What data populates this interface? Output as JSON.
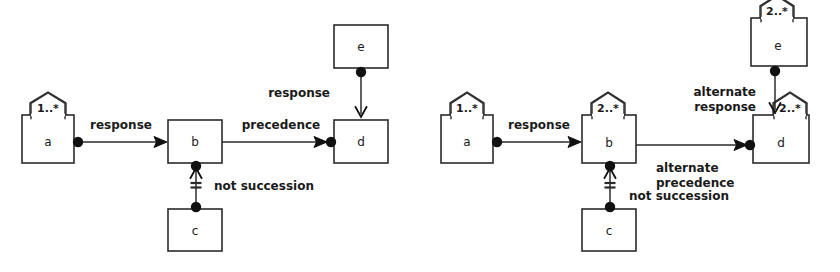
{
  "figure": {
    "type": "diagram",
    "kind": "declare-constraint-graph",
    "background_color": "#ffffff",
    "stroke_color": "#2b2b2b",
    "fill_color": "#ffffff",
    "width": 840,
    "height": 272
  },
  "diagrams": [
    {
      "id": "left",
      "nodes": [
        {
          "id": "a",
          "label": "a",
          "tag": "1..*",
          "x": 22,
          "y": 115,
          "w": 52,
          "h": 48,
          "tag_cx": 48
        },
        {
          "id": "b",
          "label": "b",
          "tag": "",
          "x": 168,
          "y": 120,
          "w": 54,
          "h": 43,
          "tag_cx": 195
        },
        {
          "id": "c",
          "label": "c",
          "tag": "",
          "x": 168,
          "y": 209,
          "w": 54,
          "h": 42,
          "tag_cx": 195
        },
        {
          "id": "d",
          "label": "d",
          "tag": "",
          "x": 334,
          "y": 120,
          "w": 54,
          "h": 43,
          "tag_cx": 361
        },
        {
          "id": "e",
          "label": "e",
          "tag": "",
          "x": 334,
          "y": 25,
          "w": 54,
          "h": 43,
          "tag_cx": 361
        }
      ],
      "edges": [
        {
          "id": "a-b",
          "label": "response",
          "from": "a",
          "to": "b",
          "type": "response",
          "label_x": 121,
          "label_y": 129
        },
        {
          "id": "b-d",
          "label": "precedence",
          "from": "b",
          "to": "d",
          "type": "precedence",
          "label_x": 281,
          "label_y": 129
        },
        {
          "id": "e-d",
          "label": "response",
          "from": "e",
          "to": "d",
          "type": "response-vertical",
          "label_x": 330,
          "label_y": 97
        },
        {
          "id": "c-b",
          "label": "not succession",
          "from": "c",
          "to": "b",
          "type": "not-succession",
          "label_x": 214,
          "label_y": 190
        }
      ]
    },
    {
      "id": "right",
      "nodes": [
        {
          "id": "a",
          "label": "a",
          "tag": "1..*",
          "x": 441,
          "y": 115,
          "w": 52,
          "h": 48,
          "tag_cx": 467
        },
        {
          "id": "b",
          "label": "b",
          "tag": "2..*",
          "x": 582,
          "y": 115,
          "w": 54,
          "h": 48,
          "tag_cx": 608
        },
        {
          "id": "c",
          "label": "c",
          "tag": "",
          "x": 582,
          "y": 209,
          "w": 54,
          "h": 42,
          "tag_cx": 609
        },
        {
          "id": "d",
          "label": "d",
          "tag": "2..*",
          "x": 753,
          "y": 115,
          "w": 56,
          "h": 48,
          "tag_cx": 790
        },
        {
          "id": "e",
          "label": "e",
          "tag": "2..*",
          "x": 751,
          "y": 18,
          "w": 56,
          "h": 48,
          "tag_cx": 777
        }
      ],
      "edges": [
        {
          "id": "a-b",
          "label": "response",
          "from": "a",
          "to": "b",
          "type": "response",
          "label_x": 539,
          "label_y": 129
        },
        {
          "id": "b-d",
          "label": "alternate precedence",
          "label_line1": "alternate",
          "label_line2": "precedence",
          "from": "b",
          "to": "d",
          "type": "precedence",
          "label_x": 656,
          "label_y": 172
        },
        {
          "id": "e-d",
          "label": "alternate response",
          "label_line1": "alternate",
          "label_line2": "response",
          "from": "e",
          "to": "d",
          "type": "response-vertical",
          "label_x": 664,
          "label_y": 91
        },
        {
          "id": "c-b",
          "label": "not succession",
          "from": "c",
          "to": "b",
          "type": "not-succession",
          "label_x": 629,
          "label_y": 196
        }
      ]
    }
  ],
  "legend": {
    "relation_names": [
      "response",
      "precedence",
      "not succession",
      "alternate response",
      "alternate precedence"
    ],
    "cardinality_tags": [
      "1..*",
      "2..*"
    ]
  }
}
